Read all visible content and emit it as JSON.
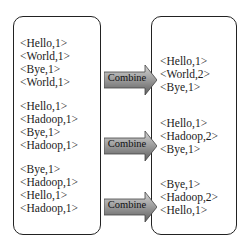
{
  "diagram": {
    "title": "",
    "input_groups": [
      {
        "pairs": [
          "<Hello,1>",
          "<World,1>",
          "<Bye,1>",
          "<World,1>"
        ]
      },
      {
        "pairs": [
          "<Hello,1>",
          "<Hadoop,1>",
          "<Bye,1>",
          "<Hadoop,1>"
        ]
      },
      {
        "pairs": [
          "<Bye,1>",
          "<Hadoop,1>",
          "<Hello,1>",
          "<Hadoop,1>"
        ]
      }
    ],
    "operation_label": "Combine",
    "operations": [
      {
        "label": "Combine"
      },
      {
        "label": "Combine"
      },
      {
        "label": "Combine"
      }
    ],
    "output_groups": [
      {
        "pairs": [
          "<Hello,1>",
          "<World,2>",
          "<Bye,1>"
        ]
      },
      {
        "pairs": [
          "<Hello,1>",
          "<Hadoop,2>",
          "<Bye,1>"
        ]
      },
      {
        "pairs": [
          "<Bye,1>",
          "<Hadoop,2>",
          "<Hello,1>"
        ]
      }
    ],
    "colors": {
      "arrow_light": "#c8c8c8",
      "arrow_dark": "#6e6e6e",
      "border": "#222222"
    }
  }
}
